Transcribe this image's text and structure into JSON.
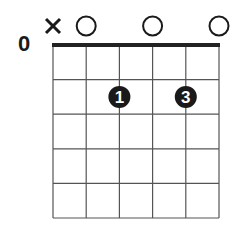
{
  "chord_diagram": {
    "starting_fret_label": "0",
    "num_strings": 6,
    "num_frets": 5,
    "string_markers": [
      {
        "string": 1,
        "marker": "x",
        "meaning": "muted"
      },
      {
        "string": 2,
        "marker": "o",
        "meaning": "open"
      },
      {
        "string": 3,
        "marker": "",
        "meaning": "fretted"
      },
      {
        "string": 4,
        "marker": "o",
        "meaning": "open"
      },
      {
        "string": 5,
        "marker": "",
        "meaning": "fretted"
      },
      {
        "string": 6,
        "marker": "o",
        "meaning": "open"
      }
    ],
    "fingers": [
      {
        "string": 3,
        "fret": 2,
        "finger": "1"
      },
      {
        "string": 5,
        "fret": 2,
        "finger": "3"
      }
    ],
    "colors": {
      "grid": "#555555",
      "nut": "#222222",
      "dot": "#1a1a1a",
      "dot_text": "#ffffff",
      "background": "#ffffff"
    }
  }
}
